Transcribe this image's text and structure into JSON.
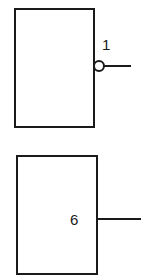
{
  "diagram": {
    "blocks": [
      {
        "id": "block-1",
        "label": "1",
        "output": "inverted"
      },
      {
        "id": "block-2",
        "label": "6",
        "output": "direct"
      }
    ],
    "stroke_color": "#1a1a1a",
    "background": "#ffffff"
  }
}
